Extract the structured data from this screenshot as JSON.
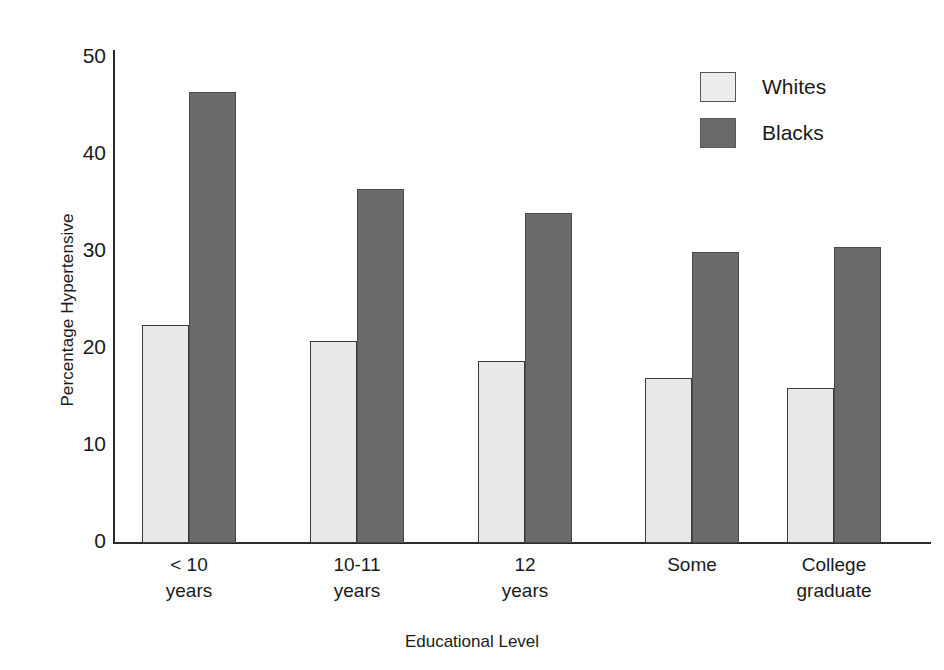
{
  "chart_data": {
    "type": "bar",
    "title": "",
    "xlabel": "Educational Level",
    "ylabel": "Percentage Hypertensive",
    "categories": [
      "< 10 years",
      "10-11 years",
      "12 years",
      "Some",
      "College graduate"
    ],
    "category_lines": [
      [
        "< 10",
        "years"
      ],
      [
        "10-11",
        "years"
      ],
      [
        "12",
        "years"
      ],
      [
        "Some"
      ],
      [
        "College",
        "graduate"
      ]
    ],
    "series": [
      {
        "name": "Whites",
        "color": "#e8e8e8",
        "values": [
          22.5,
          20.8,
          18.8,
          17.0,
          16.0
        ]
      },
      {
        "name": "Blacks",
        "color": "#6a6a6a",
        "values": [
          46.5,
          36.5,
          34.0,
          30.0,
          30.5
        ]
      }
    ],
    "ylim": [
      0,
      50
    ],
    "yticks": [
      0,
      10,
      20,
      30,
      40,
      50
    ],
    "ytick_labels": [
      "0",
      "10",
      "20",
      "30",
      "40",
      "50"
    ],
    "grid": false,
    "legend_position": "top-right"
  },
  "axes": {
    "y_title": "Percentage Hypertensive",
    "x_title": "Educational Level"
  },
  "legend": {
    "items": [
      {
        "label": "Whites",
        "swatch": "whites"
      },
      {
        "label": "Blacks",
        "swatch": "blacks"
      }
    ]
  }
}
